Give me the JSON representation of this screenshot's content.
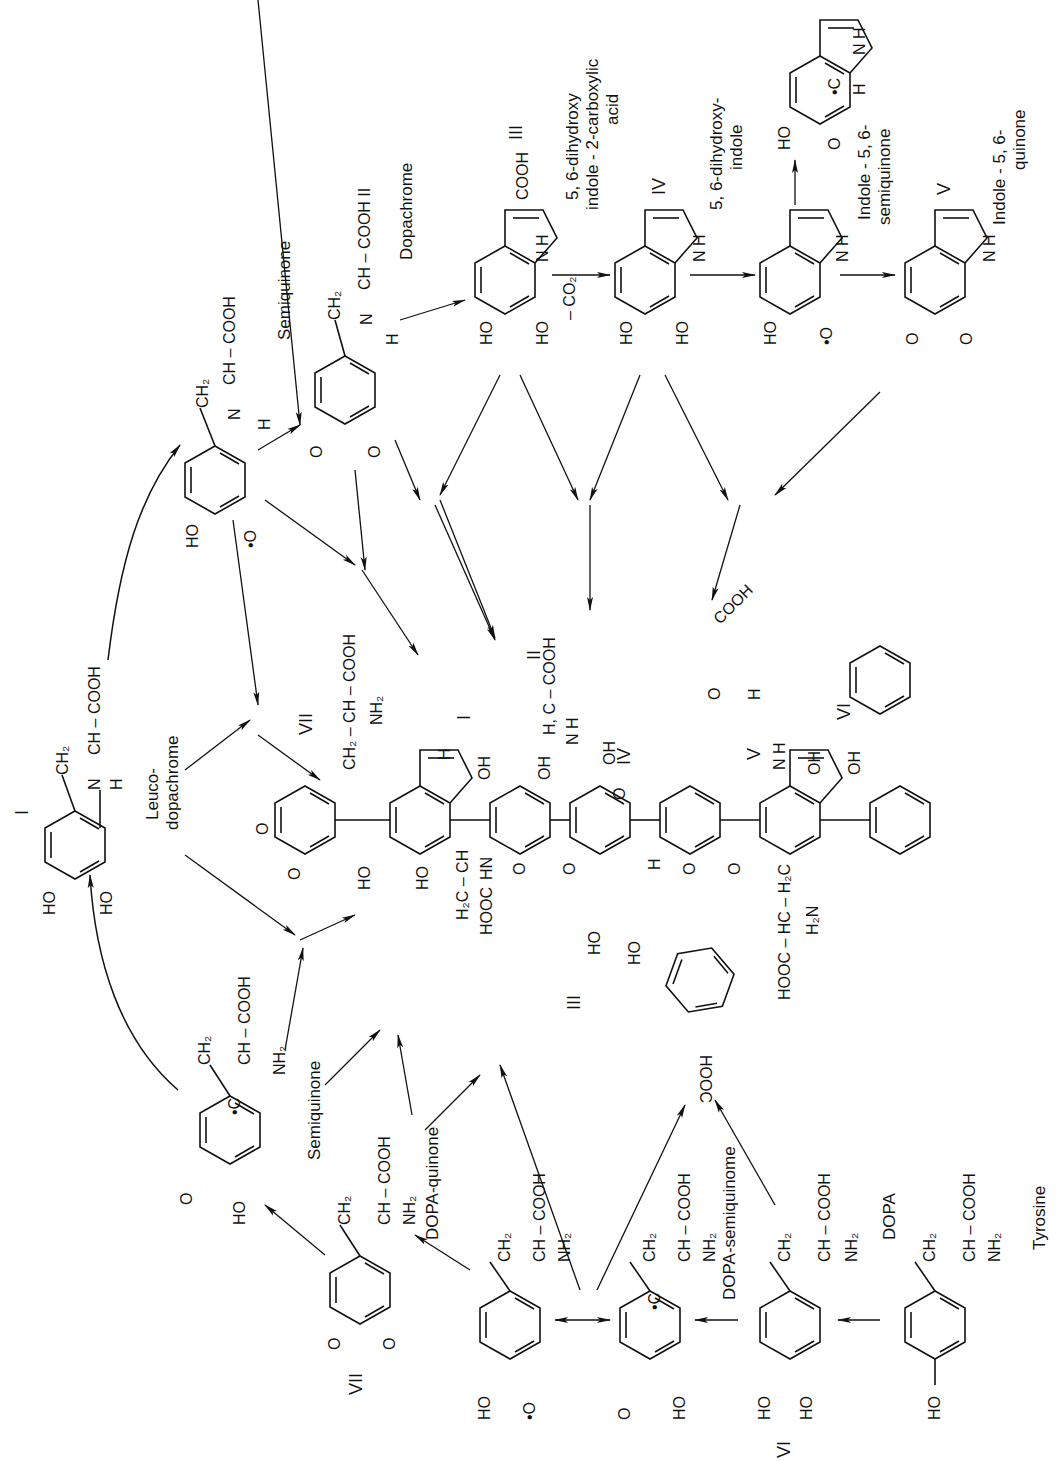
{
  "figure": {
    "orientation": "rotated 90 degrees counter-clockwise"
  },
  "compounds": {
    "tyrosine": {
      "name": "Tyrosine",
      "formula_side_chain": "CH2 – CH – COOH / NH2",
      "substituent": "HO"
    },
    "dopa": {
      "name": "DOPA",
      "numeral": "VI",
      "side_chain": "CH2 – CH – COOH / NH2",
      "substituents": [
        "HO",
        "HO"
      ]
    },
    "dopa_semiquinone": {
      "name": "DOPA-semiquinome",
      "side_chain": "CH2 – CH – COOH / NH2",
      "radical": "•C H",
      "substituents": [
        "O",
        "HO"
      ]
    },
    "dopa_radical": {
      "side_chain": "CH2 – CH – COOH / NH2",
      "substituents": [
        "HO",
        "•O"
      ]
    },
    "dopa_quinone": {
      "name": "DOPA-quinone",
      "numeral": "VII",
      "side_chain": "CH2 – CH – COOH / NH2",
      "substituents": [
        "O",
        "O"
      ]
    },
    "semiquinone_lower": {
      "name": "Semiquinone",
      "side_chain": "CH2 – CH – COOH / NH2",
      "substituents": [
        "O",
        "HO"
      ]
    },
    "leucodopachrome": {
      "name": "Leuco-dopachrome",
      "numeral": "I",
      "side_chain": "CH2 – CH – COOH",
      "nh": "N H",
      "substituents": [
        "HO",
        "HO"
      ]
    },
    "semiquinone_upper": {
      "name": "Semiquinone",
      "side_chain": "CH2 – CH – COOH",
      "nh": "N H",
      "substituents": [
        "HO",
        "•O"
      ]
    },
    "dopachrome": {
      "name": "Dopachrome",
      "numeral": "II",
      "side_chain": "CH2 – CH – COOH",
      "nh": "N H",
      "substituents": [
        "O",
        "O"
      ]
    },
    "dhica": {
      "name": "5, 6-dihydroxy indole - 2-carboxylic acid",
      "numeral": "III",
      "group": "COOH",
      "nh": "N H",
      "substituents": [
        "HO",
        "HO"
      ]
    },
    "dhi": {
      "name": "5, 6-dihydroxy-indole",
      "numeral": "IV",
      "nh": "N H",
      "substituents": [
        "HO",
        "HO"
      ]
    },
    "indole_semiquinone": {
      "name": "Indole - 5, 6-semiquinone",
      "nh": "N H",
      "substituents": [
        "HO",
        "•O"
      ],
      "alt_form": {
        "substituents": [
          "HO",
          "O"
        ],
        "radical": "•C H",
        "nh": "N H"
      }
    },
    "indole_quinone": {
      "name": "Indole - 5, 6-quinone",
      "numeral": "V",
      "nh": "N H",
      "substituents": [
        "O",
        "O"
      ]
    }
  },
  "reaction_labels": {
    "decarboxylation": "– CO2"
  },
  "polymer": {
    "unit_numerals": [
      "VII",
      "I",
      "II",
      "IV",
      "V",
      "VI",
      "III"
    ],
    "groups": [
      "CH2 – CH – COOH",
      "NH2",
      "HO",
      "OH",
      "O",
      "H2C – CH",
      "HOOC",
      "HN",
      "H, C – COOH",
      "N H",
      "COOH",
      "HOOC – HC – H2C",
      "H2N"
    ]
  },
  "text": {
    "tyrosine": "Tyrosine",
    "dopa": "DOPA",
    "dopa_semi": "DOPA-semiquinome",
    "dopa_quinone": "DOPA-quinone",
    "semiquinone": "Semiquinone",
    "leuco1": "Leuco-",
    "leuco2": "dopachrome",
    "dopachrome": "Dopachrome",
    "dhica1": "5, 6-dihydroxy",
    "dhica2": "indole - 2-carboxylic",
    "dhica3": "acid",
    "dhi1": "5, 6-dihydroxy-",
    "dhi2": "indole",
    "isq1": "Indole - 5, 6-",
    "isq2": "semiquinone",
    "iq1": "Indole - 5, 6-",
    "iq2": "quinone",
    "co2": "– CO₂",
    "cooh": "COOH",
    "chain": "CH₂ – CH – COOH",
    "chain_short": "CH – COOH",
    "ch2": "CH₂",
    "ch": "CH",
    "nh2": "NH₂",
    "ho": "HO",
    "oh": "OH",
    "o": "O",
    "dot_o": "•O",
    "nh": "N",
    "h": "H",
    "n_h": "N H",
    "ch_cooh_ii": "CH – COOH  II",
    "dot_c": "•C",
    "h2c_ch": "H₂C – CH",
    "hooc": "HOOC",
    "hn": "HN",
    "hc_cooh": "H, C – COOH",
    "hooc_hc_h2c": "HOOC – HC – H₂C",
    "h2n": "H₂N",
    "r_I": "I",
    "r_II": "II",
    "r_III": "III",
    "r_IV": "IV",
    "r_V": "V",
    "r_VI": "VI",
    "r_VII": "VII"
  }
}
